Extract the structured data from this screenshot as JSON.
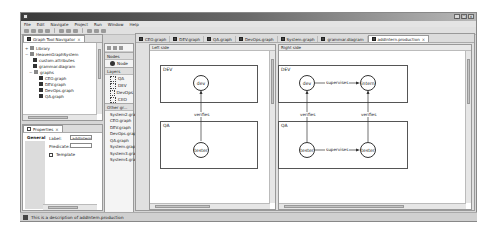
{
  "menu": [
    "File",
    "Edit",
    "Navigate",
    "Project",
    "Run",
    "Window",
    "Help"
  ],
  "window_controls": [
    "minimize",
    "maximize",
    "close"
  ],
  "navigator": {
    "tab_label": "Graph Tool Navigator",
    "tree": [
      {
        "label": "Library",
        "indent": 0,
        "expander": "+"
      },
      {
        "label": "HeavenGraphSystem",
        "indent": 0,
        "expander": "-"
      },
      {
        "label": "custom.attributes",
        "indent": 2
      },
      {
        "label": "grammar.diagram",
        "indent": 2
      },
      {
        "label": "graphs",
        "indent": 1,
        "expander": "-",
        "folder": true
      },
      {
        "label": "CEO.graph",
        "indent": 3
      },
      {
        "label": "DEV.graph",
        "indent": 3
      },
      {
        "label": "DevOps.graph",
        "indent": 3
      },
      {
        "label": "QA.graph",
        "indent": 3
      }
    ]
  },
  "properties": {
    "tab_label": "Properties",
    "section": "General",
    "label_field": {
      "label": "Label:",
      "value": "addIntern"
    },
    "predicate_field": {
      "label": "Predicate:",
      "value": ""
    },
    "template_checkbox": {
      "label": "Template",
      "checked": false
    }
  },
  "palette": {
    "nodes_header": "Nodes",
    "node_item": "Node",
    "layers_header": "Layers",
    "layers": [
      "QA",
      "DEV",
      "DevOps",
      "CEO"
    ],
    "other_header": "Other gr...",
    "graphs": [
      "System2.graph",
      "CEO.graph",
      "DEV.graph",
      "DevOps.graph",
      "QA.graph",
      "System.graph",
      "System3.graph",
      "System4.graph"
    ]
  },
  "editor_tabs": [
    {
      "label": "CEO.graph",
      "active": false
    },
    {
      "label": "DEV.graph",
      "active": false
    },
    {
      "label": "QA.graph",
      "active": false
    },
    {
      "label": "DevOps.graph",
      "active": false
    },
    {
      "label": "System.graph",
      "active": false
    },
    {
      "label": "grammar.diagram",
      "active": false
    },
    {
      "label": "addIntern.production",
      "active": true
    }
  ],
  "left_side": {
    "header": "Left side",
    "lanes": [
      "DEV",
      "QA"
    ],
    "nodes": [
      "dev",
      "tester"
    ],
    "edge_label": "verifies"
  },
  "right_side": {
    "header": "Right side",
    "lanes": [
      "DEV",
      "QA"
    ],
    "nodes": [
      "dev",
      "intern",
      "tester",
      "tester"
    ],
    "edge_labels": {
      "top": "supervises",
      "bottom": "supervises",
      "verifies_left": "verifies",
      "verifies_right": "verifies"
    }
  },
  "status": {
    "text": "This is a description of addIntern.production"
  }
}
